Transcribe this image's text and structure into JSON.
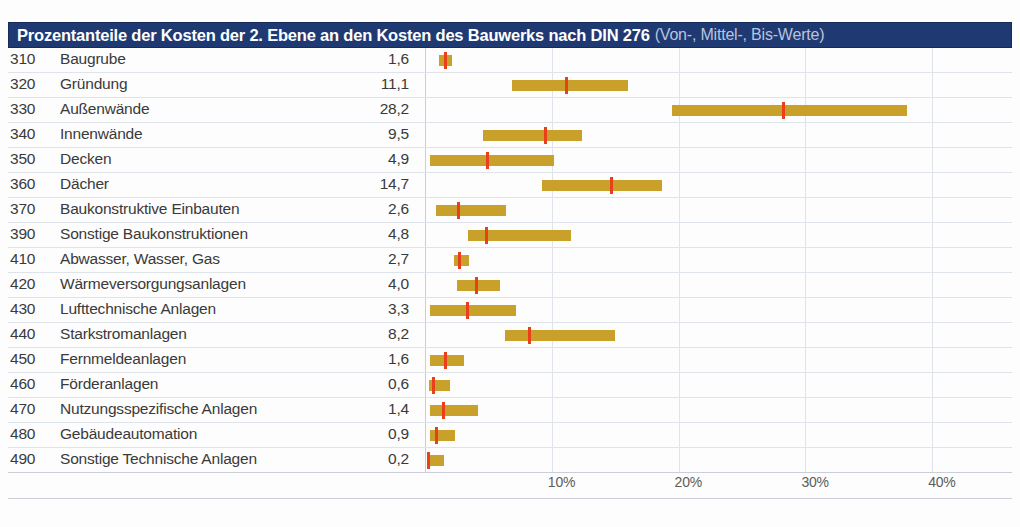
{
  "header": {
    "title_main": "Prozentanteile der Kosten der 2. Ebene an den Kosten des Bauwerks nach DIN 276",
    "title_sub": "(Von-, Mittel-, Bis-Werte)",
    "background_color": "#1f3a73",
    "text_color": "#ffffff",
    "sub_text_color": "#b9c4dc"
  },
  "colors": {
    "bar": "#c8a02a",
    "marker": "#e8401a",
    "header": "#1f3a73",
    "gridline": "#dfe3ea",
    "text": "#3a3a3a"
  },
  "chart_data": {
    "type": "bar",
    "title": "Prozentanteile der Kosten der 2. Ebene an den Kosten des Bauwerks nach DIN 276 (Von-, Mittel-, Bis-Werte)",
    "xlabel": "",
    "ylabel": "",
    "xlim": [
      0,
      47.5
    ],
    "grid": true,
    "legend": "none",
    "xticks": [
      10,
      20,
      30,
      40
    ],
    "xtick_labels": [
      "10%",
      "20%",
      "30%",
      "40%"
    ],
    "columns": [
      "Kostengruppe",
      "Bezeichnung",
      "Mittelwert",
      "Von-Wert",
      "Bis-Wert"
    ],
    "rows": [
      {
        "code": "310",
        "label": "Baugrube",
        "value": "1,6",
        "mean": 1.6,
        "from": 1.1,
        "to": 2.1
      },
      {
        "code": "320",
        "label": "Gründung",
        "value": "11,1",
        "mean": 11.1,
        "from": 6.9,
        "to": 16.0
      },
      {
        "code": "330",
        "label": "Außenwände",
        "value": "28,2",
        "mean": 28.2,
        "from": 19.5,
        "to": 38.0
      },
      {
        "code": "340",
        "label": "Innenwände",
        "value": "9,5",
        "mean": 9.5,
        "from": 4.6,
        "to": 12.4
      },
      {
        "code": "350",
        "label": "Decken",
        "value": "4,9",
        "mean": 4.9,
        "from": 0.4,
        "to": 10.2
      },
      {
        "code": "360",
        "label": "Dächer",
        "value": "14,7",
        "mean": 14.7,
        "from": 9.2,
        "to": 18.7
      },
      {
        "code": "370",
        "label": "Baukonstruktive Einbauten",
        "value": "2,6",
        "mean": 2.6,
        "from": 0.9,
        "to": 6.4
      },
      {
        "code": "390",
        "label": "Sonstige Baukonstruktionen",
        "value": "4,8",
        "mean": 4.8,
        "from": 3.4,
        "to": 11.5
      },
      {
        "code": "410",
        "label": "Abwasser, Wasser, Gas",
        "value": "2,7",
        "mean": 2.7,
        "from": 2.3,
        "to": 3.5
      },
      {
        "code": "420",
        "label": "Wärmeversorgungsanlagen",
        "value": "4,0",
        "mean": 4.0,
        "from": 2.5,
        "to": 5.9
      },
      {
        "code": "430",
        "label": "Lufttechnische Anlagen",
        "value": "3,3",
        "mean": 3.3,
        "from": 0.4,
        "to": 7.2
      },
      {
        "code": "440",
        "label": "Starkstromanlagen",
        "value": "8,2",
        "mean": 8.2,
        "from": 6.3,
        "to": 15.0
      },
      {
        "code": "450",
        "label": "Fernmeldeanlagen",
        "value": "1,6",
        "mean": 1.6,
        "from": 0.4,
        "to": 3.1
      },
      {
        "code": "460",
        "label": "Förderanlagen",
        "value": "0,6",
        "mean": 0.6,
        "from": 0.3,
        "to": 2.0
      },
      {
        "code": "470",
        "label": "Nutzungsspezifische Anlagen",
        "value": "1,4",
        "mean": 1.4,
        "from": 0.4,
        "to": 4.2
      },
      {
        "code": "480",
        "label": "Gebäudeautomation",
        "value": "0,9",
        "mean": 0.9,
        "from": 0.4,
        "to": 2.4
      },
      {
        "code": "490",
        "label": "Sonstige Technische Anlagen",
        "value": "0,2",
        "mean": 0.2,
        "from": 0.2,
        "to": 1.5
      }
    ]
  }
}
